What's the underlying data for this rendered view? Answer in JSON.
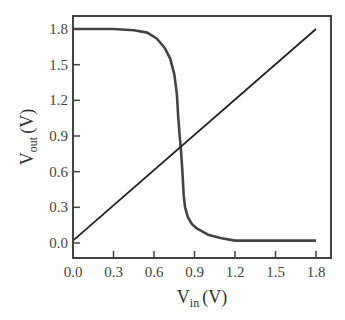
{
  "chart_data": {
    "type": "line",
    "title": "",
    "xlabel": "V_in (V)",
    "ylabel": "V_out (V)",
    "xlabel_main": "V",
    "xlabel_sub": "in",
    "xlabel_unit": "(V)",
    "ylabel_main": "V",
    "ylabel_sub": "out",
    "ylabel_unit": "(V)",
    "xlim": [
      0.0,
      1.9
    ],
    "ylim": [
      -0.1,
      1.9
    ],
    "xticks": [
      "0.0",
      "0.3",
      "0.6",
      "0.9",
      "1.2",
      "1.5",
      "1.8"
    ],
    "yticks": [
      "0.0",
      "0.3",
      "0.6",
      "0.9",
      "1.2",
      "1.5",
      "1.8"
    ],
    "grid": false,
    "legend": null,
    "series": [
      {
        "name": "VTC",
        "color": "#444444",
        "x": [
          0.0,
          0.3,
          0.45,
          0.55,
          0.62,
          0.68,
          0.72,
          0.75,
          0.77,
          0.78,
          0.79,
          0.8,
          0.81,
          0.82,
          0.83,
          0.85,
          0.88,
          0.92,
          1.0,
          1.1,
          1.2,
          1.4,
          1.6,
          1.8
        ],
        "y": [
          1.8,
          1.8,
          1.79,
          1.77,
          1.72,
          1.64,
          1.55,
          1.42,
          1.25,
          1.05,
          0.9,
          0.78,
          0.6,
          0.4,
          0.3,
          0.22,
          0.16,
          0.12,
          0.07,
          0.04,
          0.02,
          0.02,
          0.02,
          0.02
        ]
      },
      {
        "name": "Vout = Vin",
        "color": "#222222",
        "x": [
          0.0,
          1.8
        ],
        "y": [
          0.02,
          1.8
        ]
      }
    ]
  }
}
